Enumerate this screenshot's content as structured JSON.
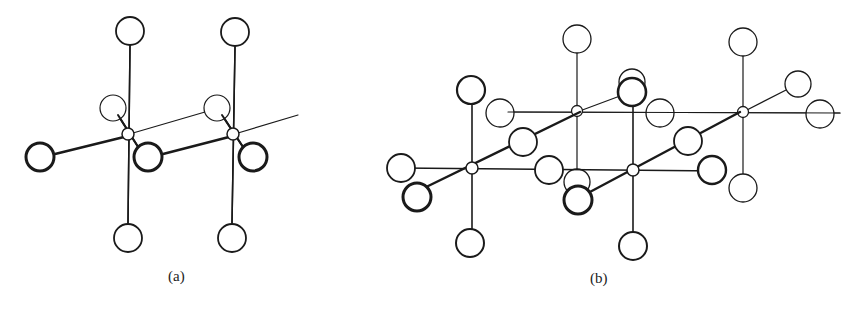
{
  "figure": {
    "panels": [
      {
        "label": "(a)"
      },
      {
        "label": "(b)"
      }
    ]
  },
  "colors": {
    "ink": "#1a1a1a",
    "background": "#ffffff"
  }
}
